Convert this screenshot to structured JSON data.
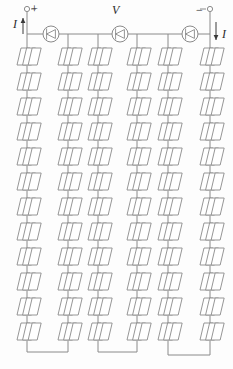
{
  "diagram": {
    "title_label": "V",
    "terminals": [
      {
        "name": "positive-terminal",
        "sign": "+",
        "x": 27,
        "y": 9
      },
      {
        "name": "negative-terminal",
        "sign": "−",
        "x": 210,
        "y": 9
      }
    ],
    "current_labels": [
      {
        "name": "current-left",
        "text": "I",
        "direction": "up"
      },
      {
        "name": "current-right",
        "text": "I",
        "direction": "down"
      }
    ],
    "bus_y": 34,
    "meters": [
      {
        "name": "meter-1",
        "cx": 51,
        "cy": 34,
        "r": 8,
        "symbol": "triangle-left"
      },
      {
        "name": "meter-2",
        "cx": 120,
        "cy": 34,
        "r": 8,
        "symbol": "triangle-left"
      },
      {
        "name": "meter-3",
        "cx": 190,
        "cy": 34,
        "r": 8,
        "symbol": "triangle-left"
      }
    ],
    "columns": [
      {
        "name": "cell-column-1",
        "x": 27,
        "cells": 12
      },
      {
        "name": "cell-column-2",
        "x": 68,
        "cells": 12
      },
      {
        "name": "cell-column-3",
        "x": 98,
        "cells": 12
      },
      {
        "name": "cell-column-4",
        "x": 137,
        "cells": 12
      },
      {
        "name": "cell-column-5",
        "x": 168,
        "cells": 12
      },
      {
        "name": "cell-column-6",
        "x": 210,
        "cells": 12
      }
    ],
    "bottom_links": [
      {
        "name": "bottom-link-1",
        "from": 0,
        "to": 1,
        "y": 352
      },
      {
        "name": "bottom-link-2",
        "from": 2,
        "to": 3,
        "y": 352
      },
      {
        "name": "bottom-link-3",
        "from": 4,
        "to": 5,
        "y": 355
      }
    ],
    "cell_geometry": {
      "top_y": 48,
      "pitch": 25,
      "plate_w": 9,
      "plate_h": 17,
      "slant": 4,
      "plates_per_cell": 3
    },
    "colors": {
      "line": "#8a8a8a",
      "text": "#2b2b2b",
      "background": "#fdfdfd",
      "plate_fill": "#ffffff"
    }
  }
}
